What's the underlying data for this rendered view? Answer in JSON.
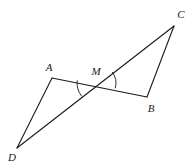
{
  "figure": {
    "type": "geometry-diagram",
    "background_color": "#ffffff",
    "stroke_color": "#1a1a1a",
    "stroke_width": 1.1,
    "width": 196,
    "height": 168
  },
  "points": {
    "A": {
      "label": "A",
      "x": 52,
      "y": 78,
      "label_x": 49,
      "label_y": 67
    },
    "B": {
      "label": "B",
      "x": 147,
      "y": 97,
      "label_x": 151,
      "label_y": 108
    },
    "C": {
      "label": "C",
      "x": 174,
      "y": 26,
      "label_x": 181,
      "label_y": 14
    },
    "D": {
      "label": "D",
      "x": 17,
      "y": 148,
      "label_x": 12,
      "label_y": 157
    },
    "M": {
      "label": "M",
      "x": 98,
      "y": 83,
      "label_x": 96,
      "label_y": 71
    }
  },
  "segments": [
    {
      "name": "segment-A-B",
      "from": "A",
      "to": "B"
    },
    {
      "name": "segment-D-C",
      "from": "D",
      "to": "C"
    },
    {
      "name": "segment-A-D",
      "from": "A",
      "to": "D"
    },
    {
      "name": "segment-B-C",
      "from": "B",
      "to": "C"
    }
  ],
  "angle_arcs": [
    {
      "name": "angle-arc-at-M-left",
      "vertex": "M",
      "radius": 21,
      "from_point": "A",
      "to_point": "D",
      "path": "M 78.6 78.4 A 21 21 0 0 0 88.9 101.0"
    },
    {
      "name": "angle-arc-at-M-right",
      "vertex": "M",
      "radius": 18,
      "from_point": "C",
      "to_point": "B",
      "path": "M 112.0 71.7 A 18 18 0 0 0 115.8 86.1"
    }
  ]
}
